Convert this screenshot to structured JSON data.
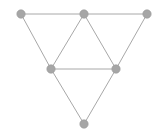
{
  "diagram": {
    "type": "graph",
    "background": "#ffffff",
    "edge_color": "#a8a8a8",
    "node_color": "#a6a6a6",
    "node_radius": 4.2,
    "nodes": [
      {
        "id": 1,
        "x": 21,
        "y": 14
      },
      {
        "id": 2,
        "x": 84,
        "y": 14
      },
      {
        "id": 3,
        "x": 147,
        "y": 14
      },
      {
        "id": 4,
        "x": 51,
        "y": 69
      },
      {
        "id": 5,
        "x": 116,
        "y": 69
      },
      {
        "id": 6,
        "x": 84,
        "y": 124
      }
    ],
    "edges": [
      [
        1,
        2
      ],
      [
        2,
        3
      ],
      [
        1,
        4
      ],
      [
        2,
        4
      ],
      [
        2,
        5
      ],
      [
        3,
        5
      ],
      [
        4,
        5
      ],
      [
        4,
        6
      ],
      [
        5,
        6
      ]
    ]
  }
}
